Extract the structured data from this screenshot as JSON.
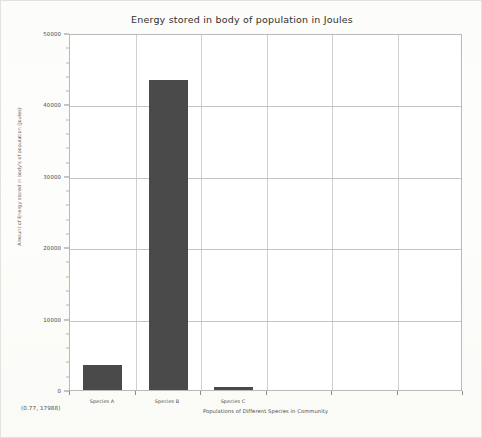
{
  "chart_data": {
    "type": "bar",
    "title": "Energy stored in body of population in Joules",
    "xlabel": "Populations of Different Species in Community",
    "ylabel": "Amount of Energy stored in body's of population (Joules)",
    "categories": [
      "Species A",
      "Species B",
      "Species C"
    ],
    "values": [
      3500,
      43400,
      400
    ],
    "ylim": [
      0,
      50000
    ],
    "ytick_labels": [
      "50000",
      "40000",
      "30000",
      "20000",
      "10000",
      "0"
    ],
    "ytick_values": [
      50000,
      40000,
      30000,
      20000,
      10000,
      0
    ],
    "grid": true,
    "legend": "none",
    "bar_color": "#4a4a4a",
    "grid_color": "#cfcfcb",
    "axis_color": "#b9b9b5",
    "vertical_gridline_count": 5,
    "plot_background": "#ffffff"
  },
  "status": {
    "coordinates": "(0.77, 17988)"
  }
}
